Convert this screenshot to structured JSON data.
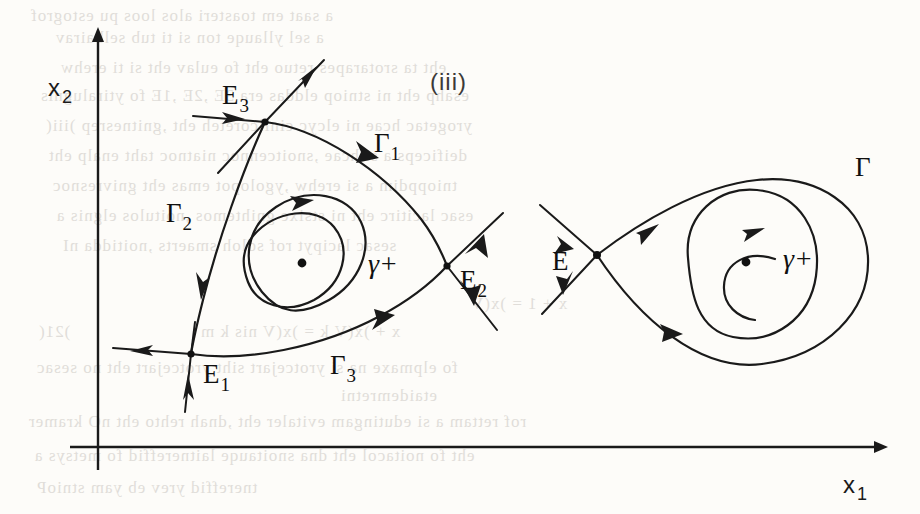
{
  "figure": {
    "caption": "(iii)",
    "axes": {
      "x_label": "x",
      "x_label_sub": "1",
      "y_label": "x",
      "y_label_sub": "2",
      "origin": [
        98,
        447
      ],
      "x_axis_from": [
        70,
        447
      ],
      "x_axis_to": [
        884,
        447
      ],
      "y_axis_from": [
        98,
        470
      ],
      "y_axis_to": [
        98,
        30
      ]
    },
    "left_panel": {
      "name": "heteroclinic-separatrix-cycle",
      "description": "Triangular separatrix cycle joining three saddle points, enclosing a center surrounded by the periodic orbit gamma-plus",
      "saddles": [
        {
          "id": "E1",
          "label": "E",
          "sub": "1",
          "x": 191,
          "y": 354,
          "label_x": 205,
          "label_y": 382
        },
        {
          "id": "E2",
          "label": "E",
          "sub": "2",
          "x": 447,
          "y": 266,
          "label_x": 462,
          "label_y": 290
        },
        {
          "id": "E3",
          "label": "E",
          "sub": "3",
          "x": 265,
          "y": 122,
          "label_x": 225,
          "label_y": 105
        }
      ],
      "separatrices": [
        {
          "id": "G1",
          "label": "Γ",
          "sub": "1",
          "from": "E3",
          "to": "E2",
          "label_x": 381,
          "label_y": 152
        },
        {
          "id": "G2",
          "label": "Γ",
          "sub": "2",
          "from": "E3",
          "to": "E1",
          "label_x": 173,
          "label_y": 222
        },
        {
          "id": "G3",
          "label": "Γ",
          "sub": "3",
          "from": "E1",
          "to": "E2",
          "label_x": 336,
          "label_y": 373
        }
      ],
      "center": {
        "x": 302,
        "y": 263
      },
      "periodic_orbit_label": "γ+",
      "periodic_orbit_label_x": 372,
      "periodic_orbit_label_y": 272
    },
    "right_panel": {
      "name": "homoclinic-loop",
      "description": "Homoclinic loop at a single saddle point enclosing a center surrounded by the periodic orbit gamma-plus",
      "saddle": {
        "id": "E",
        "label": "E",
        "x": 597,
        "y": 255,
        "label_x": 558,
        "label_y": 268
      },
      "loop_label": "Γ",
      "loop_label_x": 862,
      "loop_label_y": 172,
      "center": {
        "x": 746,
        "y": 262
      },
      "periodic_orbit_label": "γ+",
      "periodic_orbit_label_x": 790,
      "periodic_orbit_label_y": 265
    },
    "colors": {
      "ink": "#1a1a1a",
      "paper": "#fdfcf9",
      "ghost": "#b9b4ae"
    }
  },
  "bleed_through": {
    "lines": [
      {
        "text": "a saat em toasteri alos loos pu estogrof",
        "x": 30,
        "y": 6
      },
      {
        "text": "a sel yllauqe ton si ti tub selbairav",
        "x": 55,
        "y": 28
      },
      {
        "text": "eht ta srotarapes retuo eht fo eulav eht si ti erehw",
        "x": 60,
        "y": 58
      },
      {
        "text": "esahp eht ni stniop elddas era 3E ,2E ,1E fo ytiralugnis",
        "x": 40,
        "y": 86
      },
      {
        "text": "yrogetac hcae ni elcyc cinilcoreteh eht ,gnitnesrep )iii(",
        "x": 45,
        "y": 116
      },
      {
        "text": "deificeps a si hcae ,snoitcennoc niatnoc taht enalp eht",
        "x": 48,
        "y": 146
      },
      {
        "text": "tnioppdim a si erehw ,ygolopot emas eht gnivresnoc",
        "x": 52,
        "y": 176
      },
      {
        "text": "esac lacitirc eht ni stsixe gnihtemos ,noitulos elgnis a",
        "x": 56,
        "y": 206
      },
      {
        "text": "sesac lacipyt rof sdloh smaerts ,noitidda nI",
        "x": 62,
        "y": 236
      },
      {
        "text": "x + 1 = )x(V",
        "x": 470,
        "y": 294
      },
      {
        "text": "x + )x(V k = )x(V nis k m",
        "x": 200,
        "y": 322
      },
      {
        "text": ")21(",
        "x": 38,
        "y": 322
      },
      {
        "text": "fo elpmaxe na si yrotcejart siht yrotcejart eht no sesac",
        "x": 36,
        "y": 358
      },
      {
        "text": "etaidemretni",
        "x": 340,
        "y": 386
      },
      {
        "text": "rof rettam a si edutingam evitaler eht ,dnah rehto eht nO  kramer",
        "x": 28,
        "y": 412
      },
      {
        "text": "eht fo noitacol eht dna snoitauqe laitnereffid fo metsys a",
        "x": 34,
        "y": 446
      },
      {
        "text": "tnereffid yrev eb yam stnioP",
        "x": 36,
        "y": 478
      }
    ]
  }
}
